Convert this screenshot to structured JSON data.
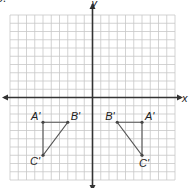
{
  "problem_number": "3.",
  "grid": {
    "x_min": -10,
    "x_max": 10,
    "y_min": -10,
    "y_max": 10,
    "origin_px": [
      92.5,
      97.5
    ],
    "cell_px": 8.25,
    "line_color": "#c8c8c8",
    "axis_color": "#333333"
  },
  "axes": {
    "x_label": "x",
    "y_label": "y"
  },
  "figures": [
    {
      "name": "left-triangle",
      "vertices": [
        {
          "label": "A'",
          "x": -6,
          "y": -3,
          "label_dx": -12,
          "label_dy": -2
        },
        {
          "label": "B'",
          "x": -3,
          "y": -3,
          "label_dx": 3,
          "label_dy": -2
        },
        {
          "label": "C'",
          "x": -6,
          "y": -7,
          "label_dx": -13,
          "label_dy": 10
        }
      ]
    },
    {
      "name": "right-triangle",
      "vertices": [
        {
          "label": "B'",
          "x": 3,
          "y": -3,
          "label_dx": -12,
          "label_dy": -2
        },
        {
          "label": "A'",
          "x": 6,
          "y": -3,
          "label_dx": 3,
          "label_dy": -2
        },
        {
          "label": "C'",
          "x": 6,
          "y": -7,
          "label_dx": -3,
          "label_dy": 12
        }
      ]
    }
  ],
  "chart_data": {
    "type": "scatter",
    "title": "",
    "xlabel": "x",
    "ylabel": "y",
    "xlim": [
      -10,
      10
    ],
    "ylim": [
      -10,
      10
    ],
    "grid": true,
    "series": [
      {
        "name": "Triangle A'B'C' (left)",
        "points": [
          {
            "label": "A'",
            "x": -6,
            "y": -3
          },
          {
            "label": "B'",
            "x": -3,
            "y": -3
          },
          {
            "label": "C'",
            "x": -6,
            "y": -7
          }
        ]
      },
      {
        "name": "Triangle A'B'C' (right)",
        "points": [
          {
            "label": "B'",
            "x": 3,
            "y": -3
          },
          {
            "label": "A'",
            "x": 6,
            "y": -3
          },
          {
            "label": "C'",
            "x": 6,
            "y": -7
          }
        ]
      }
    ]
  }
}
